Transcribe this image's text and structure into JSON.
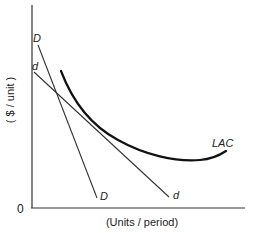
{
  "diagram": {
    "title": "",
    "axes": {
      "y_label": "( $ / unit )",
      "x_label": "(Units / period)",
      "origin_label": "0"
    },
    "curves": {
      "D": {
        "label_top": "D",
        "label_bottom": "D"
      },
      "d": {
        "label_top": "d",
        "label_bottom": "d"
      },
      "LAC": {
        "label": "LAC"
      }
    },
    "colors": {
      "ink": "#222222",
      "background": "#ffffff"
    }
  }
}
